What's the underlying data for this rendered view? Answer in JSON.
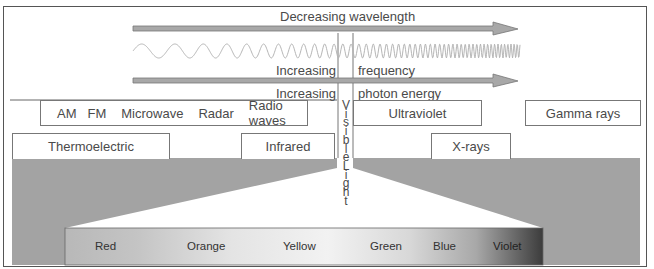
{
  "arrows": {
    "wavelength": "Decreasing wavelength",
    "frequency_left": "Increasing",
    "frequency_right": "frequency",
    "energy_left": "Increasing",
    "energy_right": "photon energy"
  },
  "bands_upper": {
    "radio_items": [
      "AM",
      "FM",
      "Microwave",
      "Radar",
      "Radio waves"
    ],
    "ultraviolet": "Ultraviolet",
    "gamma": "Gamma rays"
  },
  "bands_lower": {
    "thermoelectric": "Thermoelectric",
    "infrared": "Infrared",
    "xrays": "X-rays"
  },
  "visible_label_letters": [
    "V",
    "i",
    "s",
    "i",
    "b",
    "l",
    "e",
    "L",
    "i",
    "g",
    "h",
    "t"
  ],
  "visible_spectrum": [
    "Red",
    "Orange",
    "Yellow",
    "Green",
    "Blue",
    "Violet"
  ],
  "colors": {
    "arrow_fill": "#a8a8a8",
    "band_fill": "#a3a3a3",
    "wave_stroke": "#b5b5b5"
  }
}
